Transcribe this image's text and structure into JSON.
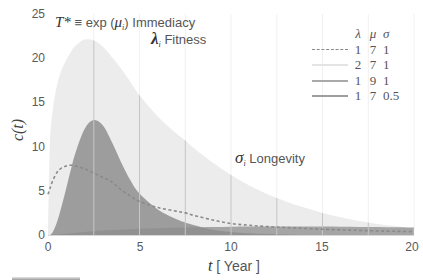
{
  "chart_data": {
    "type": "area",
    "title": "",
    "xlabel": "t [ Year ]",
    "xlabel_var": "t",
    "xlabel_unit": " [ Year ]",
    "ylabel": "c(t)",
    "xlim": [
      0,
      20
    ],
    "ylim": [
      0,
      25
    ],
    "xticks": [
      "0",
      "5",
      "10",
      "15",
      "20"
    ],
    "yticks": [
      "0",
      "5",
      "10",
      "15",
      "20",
      "25"
    ],
    "grid": {
      "vertical": true,
      "horizontal": false,
      "vertical_step": 2.5
    },
    "legend": {
      "position": "upper right",
      "header": [
        "λ",
        "μ",
        "σ"
      ]
    },
    "x": [
      0,
      0.1,
      0.25,
      0.5,
      0.75,
      1,
      1.25,
      1.5,
      2,
      2.5,
      3,
      3.5,
      4,
      4.5,
      5,
      6,
      7,
      7.5,
      8,
      9,
      10,
      11,
      12,
      13,
      14,
      15,
      16,
      17,
      18,
      19,
      20
    ],
    "series": [
      {
        "name": "λ=1, μ=7, σ=1",
        "lambda": "1",
        "mu": "7",
        "sigma": "1",
        "style": "dashed-line",
        "color": "#8a8a8a",
        "values": [
          4.6,
          5.2,
          6.1,
          7.1,
          7.6,
          7.8,
          7.9,
          7.8,
          7.5,
          7.0,
          6.5,
          6.0,
          5.1,
          4.4,
          3.8,
          3.1,
          2.7,
          2.5,
          2.2,
          1.7,
          1.3,
          1.1,
          0.95,
          0.85,
          0.75,
          0.65,
          0.58,
          0.52,
          0.46,
          0.42,
          0.38
        ]
      },
      {
        "name": "λ=2, μ=7, σ=1",
        "lambda": "2",
        "mu": "7",
        "sigma": "1",
        "style": "filled-area",
        "color": "#ececec",
        "values": [
          0,
          10,
          14,
          17,
          18.7,
          19.8,
          20.7,
          21.4,
          22.1,
          22.0,
          21.3,
          20.1,
          18.8,
          17.3,
          15.8,
          13.4,
          11.5,
          10.7,
          9.8,
          8.2,
          6.8,
          5.6,
          4.6,
          3.8,
          3.1,
          2.5,
          2.0,
          1.6,
          1.25,
          1.0,
          0.8
        ]
      },
      {
        "name": "λ=1, μ=9, σ=1",
        "lambda": "1",
        "mu": "9",
        "sigma": "1",
        "style": "filled-area",
        "color": "#8e8e8e",
        "values": [
          0,
          0,
          0.02,
          0.06,
          0.1,
          0.15,
          0.2,
          0.25,
          0.35,
          0.43,
          0.5,
          0.56,
          0.61,
          0.66,
          0.7,
          0.77,
          0.82,
          0.85,
          0.87,
          0.91,
          0.94,
          0.96,
          0.97,
          0.97,
          0.96,
          0.95,
          0.93,
          0.91,
          0.89,
          0.87,
          0.85
        ]
      },
      {
        "name": "λ=1, μ=7, σ=0.5",
        "lambda": "1",
        "mu": "7",
        "sigma": "0.5",
        "style": "filled-area",
        "color": "#9d9d9d",
        "values": [
          0,
          0,
          0.3,
          1.5,
          3.3,
          5.3,
          7.4,
          9.3,
          12.0,
          13.0,
          12.4,
          10.5,
          8.2,
          6.2,
          4.7,
          2.9,
          1.8,
          1.4,
          1.1,
          0.6,
          0.35,
          0.2,
          0.1,
          0.05,
          0,
          0,
          0,
          0,
          0,
          0,
          0
        ]
      }
    ],
    "legend_line_colors": [
      "#8a8a8a",
      "#e4e4e4",
      "#a9a9a9",
      "#9d9d9d"
    ],
    "annotations": [
      {
        "symbol": "T*",
        "relation": " ≡ exp (",
        "param": "μ",
        "subscript": "i",
        "close": ")",
        "label": " Immediacy"
      },
      {
        "symbol": "λ",
        "subscript": "i",
        "label": " Fitness"
      },
      {
        "symbol": "σ",
        "subscript": "i",
        "label": " Longevity"
      }
    ]
  }
}
